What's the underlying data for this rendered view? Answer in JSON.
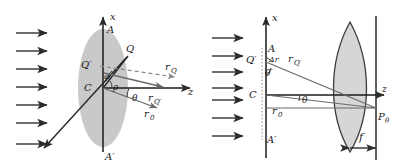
{
  "figure": {
    "type": "optics-ray-diagram",
    "panels": [
      "left-aperture-panel",
      "right-lens-panel"
    ]
  },
  "colors": {
    "ink": "#1a1a1a",
    "ray": "#5a5a5a",
    "aperture_fill": "#c9c9c9",
    "lens_fill": "#d6d6d6",
    "dashed": "#7a7a7a",
    "arrow": "#2b2b2b",
    "background": "#ffffff"
  },
  "left_panel": {
    "axis_x_label": "x",
    "axis_z_label": "z",
    "aperture_top_label": "A",
    "aperture_bottom_label": "A′",
    "center_label": "C",
    "point_q_label": "Q",
    "point_q_prime_label": "Q′",
    "angle_phi_label": "φ",
    "angle_rho_label": "ρ",
    "angle_theta_label": "θ",
    "vector_rq_label": "r",
    "vector_rq_sub": "Q",
    "vector_rqp_label": "r",
    "vector_rqp_sub": "Q′",
    "vector_r0_label": "r",
    "vector_r0_sub": "0",
    "incoming_wave_arrow_count": 7,
    "incoming_wave_name": "incident-plane-wave"
  },
  "right_panel": {
    "axis_x_label": "x",
    "axis_z_label": "z",
    "aperture_top_label": "A",
    "aperture_bottom_label": "A′",
    "center_label": "C",
    "point_q_prime_label": "Q′",
    "delta_r_label": "Δr",
    "angle_theta_prime_label": "θ′",
    "angle_theta_label": "θ",
    "vector_rqp_label": "r",
    "vector_rqp_sub": "Q′",
    "vector_r0_label": "r",
    "vector_r0_sub": "0",
    "focal_point_label": "P",
    "focal_point_sub": "θ",
    "focal_length_label": "f",
    "incoming_wave_arrow_count": 7,
    "lens_name": "converging-lens",
    "screen_name": "focal-plane-screen"
  }
}
